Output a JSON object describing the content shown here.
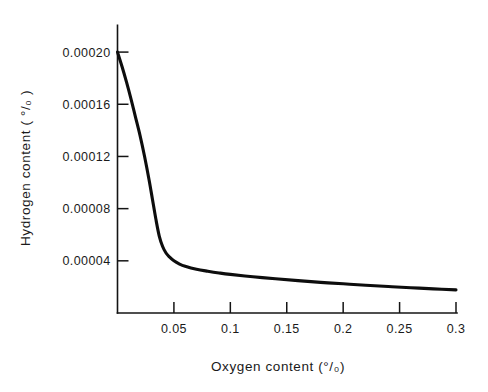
{
  "chart_data": {
    "type": "line",
    "title": "",
    "xlabel": "Oxygen content (°/₀)",
    "ylabel": "Hydrogen content ( °/₀ )",
    "xlim": [
      0.0,
      0.3
    ],
    "ylim": [
      0.0,
      0.00022
    ],
    "grid": false,
    "legend": false,
    "xticks": [
      0.05,
      0.1,
      0.15,
      0.2,
      0.25,
      0.3
    ],
    "xticklabels": [
      "0.05",
      "0.1",
      "0.15",
      "0.2",
      "0.25",
      "0.3"
    ],
    "yticks": [
      4e-05,
      8e-05,
      0.00012,
      0.00016,
      0.0002
    ],
    "yticklabels": [
      "0.00004",
      "0.00008",
      "0.00012",
      "0.00016",
      "0.00020"
    ],
    "series": [
      {
        "name": "hydrogen-oxygen-equilibrium",
        "x": [
          0.0,
          0.004,
          0.008,
          0.012,
          0.016,
          0.02,
          0.024,
          0.028,
          0.031,
          0.034,
          0.037,
          0.04,
          0.043,
          0.046,
          0.05,
          0.055,
          0.06,
          0.07,
          0.08,
          0.09,
          0.1,
          0.12,
          0.14,
          0.16,
          0.18,
          0.2,
          0.22,
          0.24,
          0.26,
          0.28,
          0.3
        ],
        "y": [
          0.0002,
          0.000189,
          0.000177,
          0.000164,
          0.00015,
          0.000136,
          0.00012,
          0.000102,
          8.7e-05,
          7.2e-05,
          5.9e-05,
          5.1e-05,
          4.6e-05,
          4.3e-05,
          4e-05,
          3.75e-05,
          3.58e-05,
          3.35e-05,
          3.2e-05,
          3.07e-05,
          2.96e-05,
          2.78e-05,
          2.62e-05,
          2.48e-05,
          2.35e-05,
          2.24e-05,
          2.13e-05,
          2.03e-05,
          1.94e-05,
          1.85e-05,
          1.77e-05
        ]
      }
    ]
  },
  "style": {
    "curve_color": "#0d0d0d",
    "axis_color": "#141414",
    "background": "#ffffff"
  }
}
